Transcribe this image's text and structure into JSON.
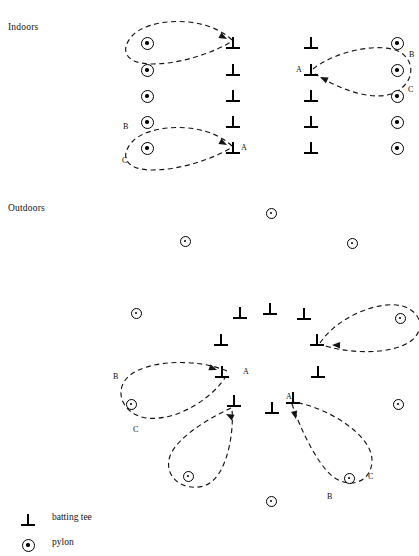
{
  "figure": {
    "sections": [
      {
        "id": "indoors",
        "label": "Indoors",
        "x": 8,
        "y": 22
      },
      {
        "id": "outdoors",
        "label": "Outdoors",
        "x": 8,
        "y": 203
      }
    ],
    "legend": [
      {
        "icon": "batting-tee-icon",
        "label": "batting tee"
      },
      {
        "icon": "pylon-icon",
        "label": "pylon"
      }
    ],
    "markers": {
      "indoors": {
        "pylons": [
          {
            "x": 147,
            "y": 43
          },
          {
            "x": 147,
            "y": 70
          },
          {
            "x": 147,
            "y": 96
          },
          {
            "x": 147,
            "y": 122
          },
          {
            "x": 147,
            "y": 148
          },
          {
            "x": 397,
            "y": 43
          },
          {
            "x": 397,
            "y": 70
          },
          {
            "x": 397,
            "y": 96
          },
          {
            "x": 397,
            "y": 122
          },
          {
            "x": 397,
            "y": 148
          }
        ],
        "tees": [
          {
            "x": 233,
            "y": 43
          },
          {
            "x": 233,
            "y": 70
          },
          {
            "x": 233,
            "y": 96
          },
          {
            "x": 233,
            "y": 122
          },
          {
            "x": 233,
            "y": 148
          },
          {
            "x": 311,
            "y": 43
          },
          {
            "x": 311,
            "y": 70
          },
          {
            "x": 311,
            "y": 96
          },
          {
            "x": 311,
            "y": 122
          },
          {
            "x": 311,
            "y": 148
          }
        ]
      },
      "outdoors": {
        "pylons": [
          {
            "x": 271,
            "y": 213
          },
          {
            "x": 185,
            "y": 241
          },
          {
            "x": 352,
            "y": 243
          },
          {
            "x": 136,
            "y": 313
          },
          {
            "x": 400,
            "y": 318
          },
          {
            "x": 131,
            "y": 404
          },
          {
            "x": 188,
            "y": 476
          },
          {
            "x": 349,
            "y": 478
          },
          {
            "x": 398,
            "y": 404
          },
          {
            "x": 271,
            "y": 501
          }
        ],
        "tees": [
          {
            "x": 240,
            "y": 313
          },
          {
            "x": 270,
            "y": 309
          },
          {
            "x": 304,
            "y": 314
          },
          {
            "x": 221,
            "y": 340
          },
          {
            "x": 317,
            "y": 340
          },
          {
            "x": 222,
            "y": 372
          },
          {
            "x": 318,
            "y": 372
          },
          {
            "x": 234,
            "y": 401
          },
          {
            "x": 272,
            "y": 408
          },
          {
            "x": 293,
            "y": 398
          }
        ]
      }
    },
    "path_labels": [
      {
        "text": "A",
        "x": 241,
        "y": 143,
        "group": "indoors-left"
      },
      {
        "text": "B",
        "x": 123,
        "y": 122,
        "group": "indoors-left"
      },
      {
        "text": "C",
        "x": 122,
        "y": 156,
        "group": "indoors-left"
      },
      {
        "text": "A",
        "x": 296,
        "y": 65,
        "group": "indoors-right"
      },
      {
        "text": "B",
        "x": 409,
        "y": 50,
        "group": "indoors-right"
      },
      {
        "text": "C",
        "x": 408,
        "y": 85,
        "group": "indoors-right"
      },
      {
        "text": "A",
        "x": 243,
        "y": 367,
        "group": "outdoors-left"
      },
      {
        "text": "B",
        "x": 113,
        "y": 372,
        "group": "outdoors-left"
      },
      {
        "text": "C",
        "x": 133,
        "y": 425,
        "group": "outdoors-left"
      },
      {
        "text": "A",
        "x": 286,
        "y": 392,
        "group": "outdoors-right"
      },
      {
        "text": "B",
        "x": 327,
        "y": 492,
        "group": "outdoors-right"
      },
      {
        "text": "C",
        "x": 368,
        "y": 472,
        "group": "outdoors-right"
      }
    ],
    "loop_paths": [
      {
        "id": "indoors-left-top",
        "d": "M 232 40 C 205 14, 148 18, 132 36 C 118 52, 128 64, 152 64 C 182 64, 214 52, 231 42"
      },
      {
        "id": "indoors-left-bottom",
        "d": "M 232 146 C 205 120, 148 124, 132 142 C 118 158, 128 170, 152 170 C 182 170, 214 158, 231 148"
      },
      {
        "id": "indoors-right",
        "d": "M 313 69 C 337 50, 382 42, 400 52 C 416 62, 414 82, 396 92 C 372 104, 334 86, 315 74"
      },
      {
        "id": "outdoors-right-mid",
        "d": "M 320 343 C 338 316, 380 300, 402 306 C 424 312, 426 334, 406 344 C 382 356, 342 352, 323 345"
      },
      {
        "id": "outdoors-left",
        "d": "M 227 371 C 196 358, 148 360, 129 376 C 113 390, 122 414, 146 418 C 180 422, 216 394, 226 376"
      },
      {
        "id": "outdoors-mid",
        "d": "M 231 408 C 210 418, 178 436, 170 456 C 163 476, 182 492, 204 486 C 228 478, 234 430, 232 410"
      },
      {
        "id": "outdoors-right-low",
        "d": "M 292 404 C 300 428, 316 462, 332 476 C 350 490, 372 482, 372 460 C 372 436, 330 408, 294 402"
      }
    ],
    "arrows": [
      {
        "id": "arrow-indoors-left-top",
        "x": 227,
        "y": 39,
        "angle": 28
      },
      {
        "id": "arrow-indoors-left-bottom",
        "x": 227,
        "y": 145,
        "angle": 28
      },
      {
        "id": "arrow-indoors-right",
        "x": 320,
        "y": 77,
        "angle": 205
      },
      {
        "id": "arrow-outdoors-right-mid",
        "x": 332,
        "y": 345,
        "angle": 182
      },
      {
        "id": "arrow-outdoors-left",
        "x": 217,
        "y": 370,
        "angle": 20
      },
      {
        "id": "arrow-outdoors-mid",
        "x": 226,
        "y": 414,
        "angle": 207
      },
      {
        "id": "arrow-outdoors-right-low",
        "x": 296,
        "y": 419,
        "angle": 76
      }
    ]
  }
}
